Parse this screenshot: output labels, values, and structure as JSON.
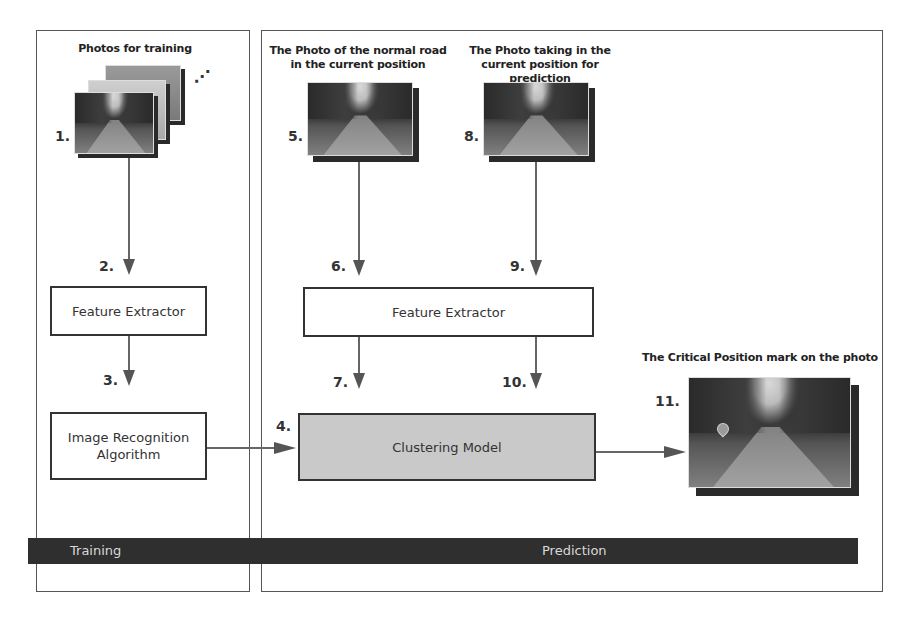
{
  "panels": {
    "training": {
      "label": "Training"
    },
    "prediction": {
      "label": "Prediction"
    }
  },
  "training": {
    "photos_title": "Photos for training",
    "step1": "1.",
    "step2": "2.",
    "step3": "3.",
    "feature_extractor": "Feature Extractor",
    "recognition_line1": "Image Recognition",
    "recognition_line2": "Algorithm",
    "more_indicator": "⋰"
  },
  "prediction": {
    "normal_photo_title_line1": "The Photo of the normal road",
    "normal_photo_title_line2": "in the current position",
    "current_photo_title_line1": "The Photo taking in the",
    "current_photo_title_line2": "current position for prediction",
    "step4": "4.",
    "step5": "5.",
    "step6": "6.",
    "step7": "7.",
    "step8": "8.",
    "step9": "9.",
    "step10": "10.",
    "step11": "11.",
    "feature_extractor": "Feature Extractor",
    "clustering_model": "Clustering Model",
    "output_title": "The Critical Position mark on the photo",
    "output_marker_icon": "location-pin-icon"
  },
  "colors": {
    "clustering_fill": "#c9c9c9",
    "band": "#2f2f2f",
    "band_text": "#d8d8d8",
    "arrow": "#555555"
  }
}
